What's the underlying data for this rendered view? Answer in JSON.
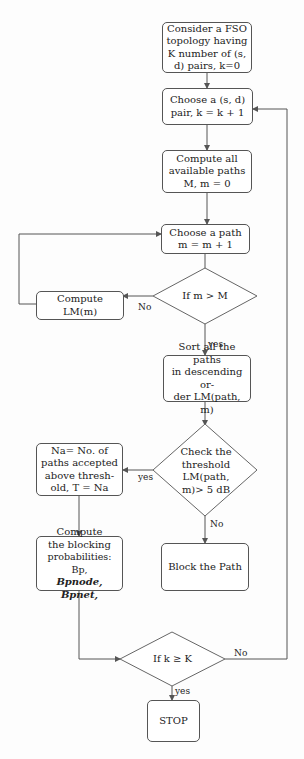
{
  "diagram": {
    "nodes": {
      "start": {
        "lines": [
          "Consider a FSO",
          "topology having",
          "K number of (s,",
          "d) pairs, k=0"
        ]
      },
      "choose_pair": {
        "lines": [
          "Choose a (s, d)",
          "pair, k = k + 1"
        ]
      },
      "compute_paths": {
        "lines": [
          "Compute all",
          "available paths",
          "M, m = 0"
        ]
      },
      "choose_path": {
        "lines": [
          "Choose a path",
          "m = m + 1"
        ]
      },
      "decision_m": {
        "text": "If m > M"
      },
      "compute_lm": {
        "text": "Compute LM(m)"
      },
      "sort_paths": {
        "lines": [
          "Sort all the paths",
          "in descending or-",
          "der LM(path, m)"
        ]
      },
      "decision_threshold": {
        "lines": [
          "Check the",
          "threshold",
          "LM(path,",
          "m)> 5 dB"
        ]
      },
      "accepted": {
        "lines": [
          "Na= No. of",
          "paths accepted",
          "above thresh-",
          "old, T = Na"
        ]
      },
      "blocking": {
        "lines": [
          "Compute",
          "the blocking",
          "probabilities: Bp,",
          "Bpnode, Bpnet,"
        ]
      },
      "block_path": {
        "text": "Block the Path"
      },
      "decision_k": {
        "text": "If k ≥ K"
      },
      "stop": {
        "text": "STOP"
      }
    },
    "edge_labels": {
      "m_no": "No",
      "m_yes": "yes",
      "threshold_yes": "yes",
      "threshold_no": "No",
      "k_no": "No",
      "k_yes": "yes"
    },
    "colors": {
      "line": "#555555",
      "background": "#fdfdfd"
    }
  }
}
